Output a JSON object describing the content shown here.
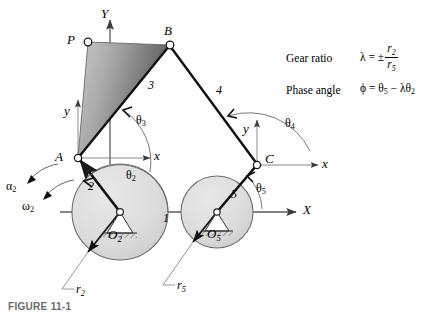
{
  "figure": {
    "caption": "FIGURE 11-1"
  },
  "equations": {
    "gear_ratio": {
      "name": "Gear ratio",
      "symbol": "λ",
      "equals": "=",
      "sign": "±",
      "numerator": "r",
      "numerator_sub": "2",
      "denominator": "r",
      "denominator_sub": "5"
    },
    "phase_angle": {
      "name": "Phase angle",
      "symbol": "ϕ",
      "equals": "=",
      "term1": "θ",
      "term1_sub": "5",
      "operator": "−",
      "term2_lambda": "λθ",
      "term2_sub": "2"
    }
  },
  "points": {
    "P": "P",
    "B": "B",
    "A": "A",
    "C": "C",
    "O2": "O",
    "O2_sub": "2",
    "O5": "O",
    "O5_sub": "5"
  },
  "links": {
    "link1": "1",
    "link2": "2",
    "link3": "3",
    "link4": "4",
    "link5": "5"
  },
  "angles": {
    "theta2": "θ",
    "theta2_sub": "2",
    "theta3": "θ",
    "theta3_sub": "3",
    "theta4": "θ",
    "theta4_sub": "4",
    "theta5": "θ",
    "theta5_sub": "5",
    "alpha2": "α",
    "alpha2_sub": "2",
    "omega2": "ω",
    "omega2_sub": "2"
  },
  "axes": {
    "global_Y": "Y",
    "global_X": "X",
    "local_y_A": "y",
    "local_x_A": "x",
    "local_y_C": "y",
    "local_x_C": "x"
  },
  "radii": {
    "r2": "r",
    "r2_sub": "2",
    "r5": "r",
    "r5_sub": "5"
  },
  "colors": {
    "gear_fill": "#dcdcdc",
    "gear_stroke": "#555555",
    "coupler_light": "#c0c0c0",
    "coupler_dark": "#5e5e5e",
    "link_stroke": "#1a1a1a",
    "axis_stroke": "#7a7a7a",
    "text": "#000000"
  }
}
